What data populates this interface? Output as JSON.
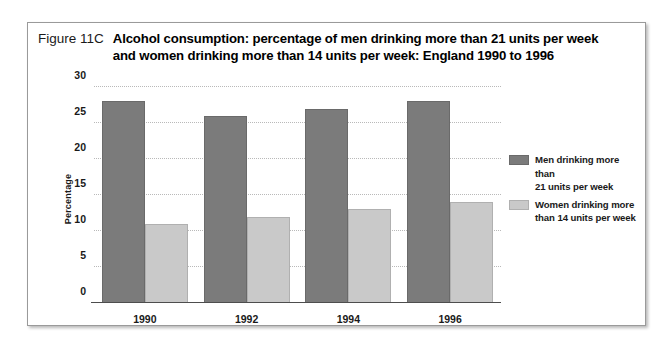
{
  "figure": {
    "number_label": "Figure 11C",
    "title_line_1": "Alcohol consumption: percentage of men drinking more than 21 units per week",
    "title_line_2": "and women drinking more than 14 units per week: England 1990 to 1996"
  },
  "colors": {
    "men_bar": "#7b7b7b",
    "women_bar": "#c9c9c9",
    "gridline": "#b9b9b9",
    "axis": "#4d4d4d",
    "frame_border": "#9a9a9a"
  },
  "legend": {
    "position": "right",
    "entries": [
      {
        "label_line_1": "Men drinking more than",
        "label_line_2": "21 units per week",
        "swatch": "men"
      },
      {
        "label_line_1": "Women drinking more",
        "label_line_2": "than 14 units per week",
        "swatch": "women"
      }
    ]
  },
  "chart_data": {
    "type": "bar",
    "title": "Alcohol consumption: percentage of men drinking more than 21 units per week and women drinking more than 14 units per week: England 1990 to 1996",
    "xlabel": "",
    "ylabel": "Percentage",
    "categories": [
      "1990",
      "1992",
      "1994",
      "1996"
    ],
    "series": [
      {
        "name": "Men drinking more than 21 units per week",
        "values": [
          28,
          26,
          27,
          28
        ]
      },
      {
        "name": "Women drinking more than 14 units per week",
        "values": [
          11,
          12,
          13,
          14
        ]
      }
    ],
    "ylim": [
      0,
      30
    ],
    "ytick_values": [
      0,
      5,
      10,
      15,
      20,
      25,
      30
    ],
    "ytick_labels": [
      "0",
      "5",
      "10",
      "15",
      "20",
      "25",
      "30"
    ],
    "grid": true,
    "grid_axis": "y",
    "legend_position": "right"
  }
}
